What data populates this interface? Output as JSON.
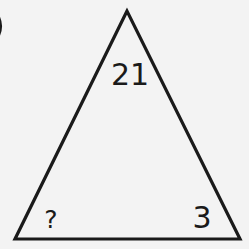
{
  "diagram": {
    "type": "number-triangle-puzzle",
    "corner_fragment": ")",
    "labels": {
      "top": "21",
      "bottom_left": "?",
      "bottom_right": "3"
    },
    "colors": {
      "background": "#f3f3f3",
      "stroke": "#1a1a1a"
    }
  }
}
